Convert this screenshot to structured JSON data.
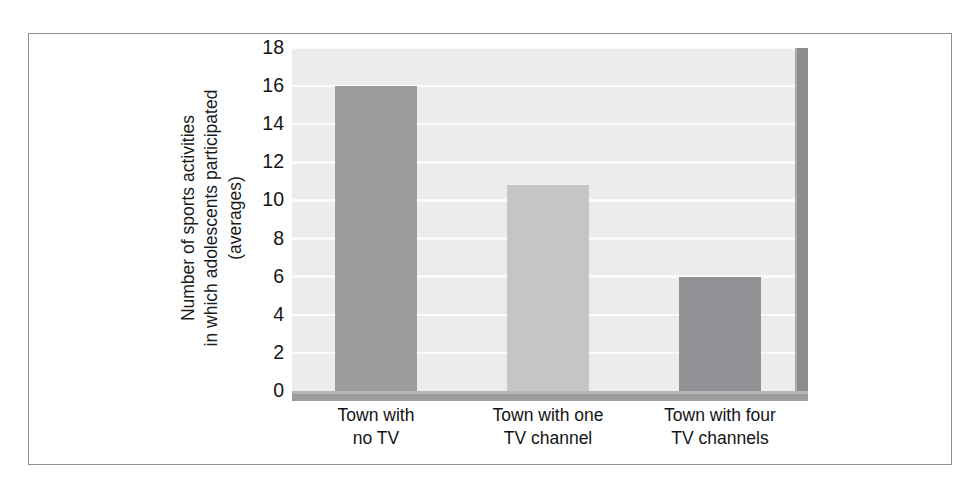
{
  "chart_data": {
    "type": "bar",
    "title": "",
    "xlabel": "",
    "ylabel": "Number of sports activities in which adolescents participated (averages)",
    "ylabel_lines": [
      "Number of sports activities",
      "in which adolescents participated",
      "(averages)"
    ],
    "categories": [
      "Town with no TV",
      "Town with one TV channel",
      "Town with four TV channels"
    ],
    "category_lines": [
      [
        "Town with",
        "no TV"
      ],
      [
        "Town with one",
        "TV channel"
      ],
      [
        "Town with four",
        "TV channels"
      ]
    ],
    "values": [
      16,
      10.8,
      6
    ],
    "ylim": [
      0,
      18
    ],
    "ytick_values": [
      0,
      2,
      4,
      6,
      8,
      10,
      12,
      14,
      16,
      18
    ],
    "ytick_labels": [
      "0",
      "2",
      "4",
      "6",
      "8",
      "10",
      "12",
      "14",
      "16",
      "18"
    ],
    "grid": true,
    "grid_axis": "y",
    "legend": false,
    "bar_colors": [
      "#9a9c9e",
      "#c3c5c7",
      "#909295"
    ],
    "plot_background": "#ececec",
    "gridline_color": "#fbfbfb",
    "frame_color": "#8d8f92",
    "axis_wall_color": "#8b8d90",
    "text_color": "#141414"
  }
}
